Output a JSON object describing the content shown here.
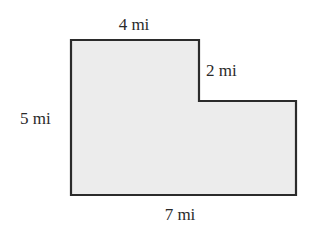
{
  "figure": {
    "type": "L-shaped polygon (rectilinear)",
    "fill_color": "#ececec",
    "stroke_color": "#2b2b2b",
    "labels": {
      "top": "4 mi",
      "notch_vertical": "2 mi",
      "left": "5 mi",
      "bottom": "7 mi"
    },
    "dimensions": {
      "top_width": 4,
      "notch_height": 2,
      "left_height": 5,
      "bottom_width": 7,
      "unit": "mi"
    }
  }
}
